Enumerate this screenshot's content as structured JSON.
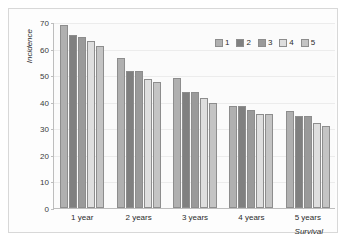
{
  "chart_data": {
    "type": "bar",
    "title": "",
    "subtitle": "",
    "xlabel": "Survival",
    "ylabel": "Incidence",
    "categories": [
      "1 year",
      "2 years",
      "3 years",
      "4 years",
      "5 years"
    ],
    "ylim": [
      0,
      70
    ],
    "yticks": [
      0,
      10,
      20,
      30,
      40,
      50,
      60,
      70
    ],
    "ytick_labels": [
      "0",
      "10",
      "20",
      "30",
      "40",
      "50",
      "60",
      "70"
    ],
    "grid": true,
    "legend_position": "top-right",
    "series": [
      {
        "name": "1",
        "color": "#b0b0b0",
        "values": [
          69,
          56.5,
          49,
          38.5,
          36.5
        ]
      },
      {
        "name": "2",
        "color": "#808080",
        "values": [
          65,
          51.5,
          43.5,
          38.5,
          34.5
        ]
      },
      {
        "name": "3",
        "color": "#9a9a9a",
        "values": [
          64.5,
          51.5,
          43.5,
          37,
          34.5
        ]
      },
      {
        "name": "4",
        "color": "#dedede",
        "values": [
          63,
          48.5,
          41.5,
          35.5,
          32
        ]
      },
      {
        "name": "5",
        "color": "#c4c4c4",
        "values": [
          61,
          47.5,
          39.5,
          35.5,
          31
        ]
      }
    ]
  },
  "legend": {
    "items": [
      {
        "label": "1"
      },
      {
        "label": "2"
      },
      {
        "label": "3"
      },
      {
        "label": "4"
      },
      {
        "label": "5"
      }
    ]
  },
  "colors": {
    "series_1": "#b0b0b0",
    "series_2": "#808080",
    "series_3": "#9a9a9a",
    "series_4": "#dedede",
    "series_5": "#c4c4c4",
    "axis": "#bdbdbd",
    "grid": "#ececec",
    "frame": "#d8d8d8",
    "background": "#fdfdfd",
    "text": "#2b2b2b"
  }
}
